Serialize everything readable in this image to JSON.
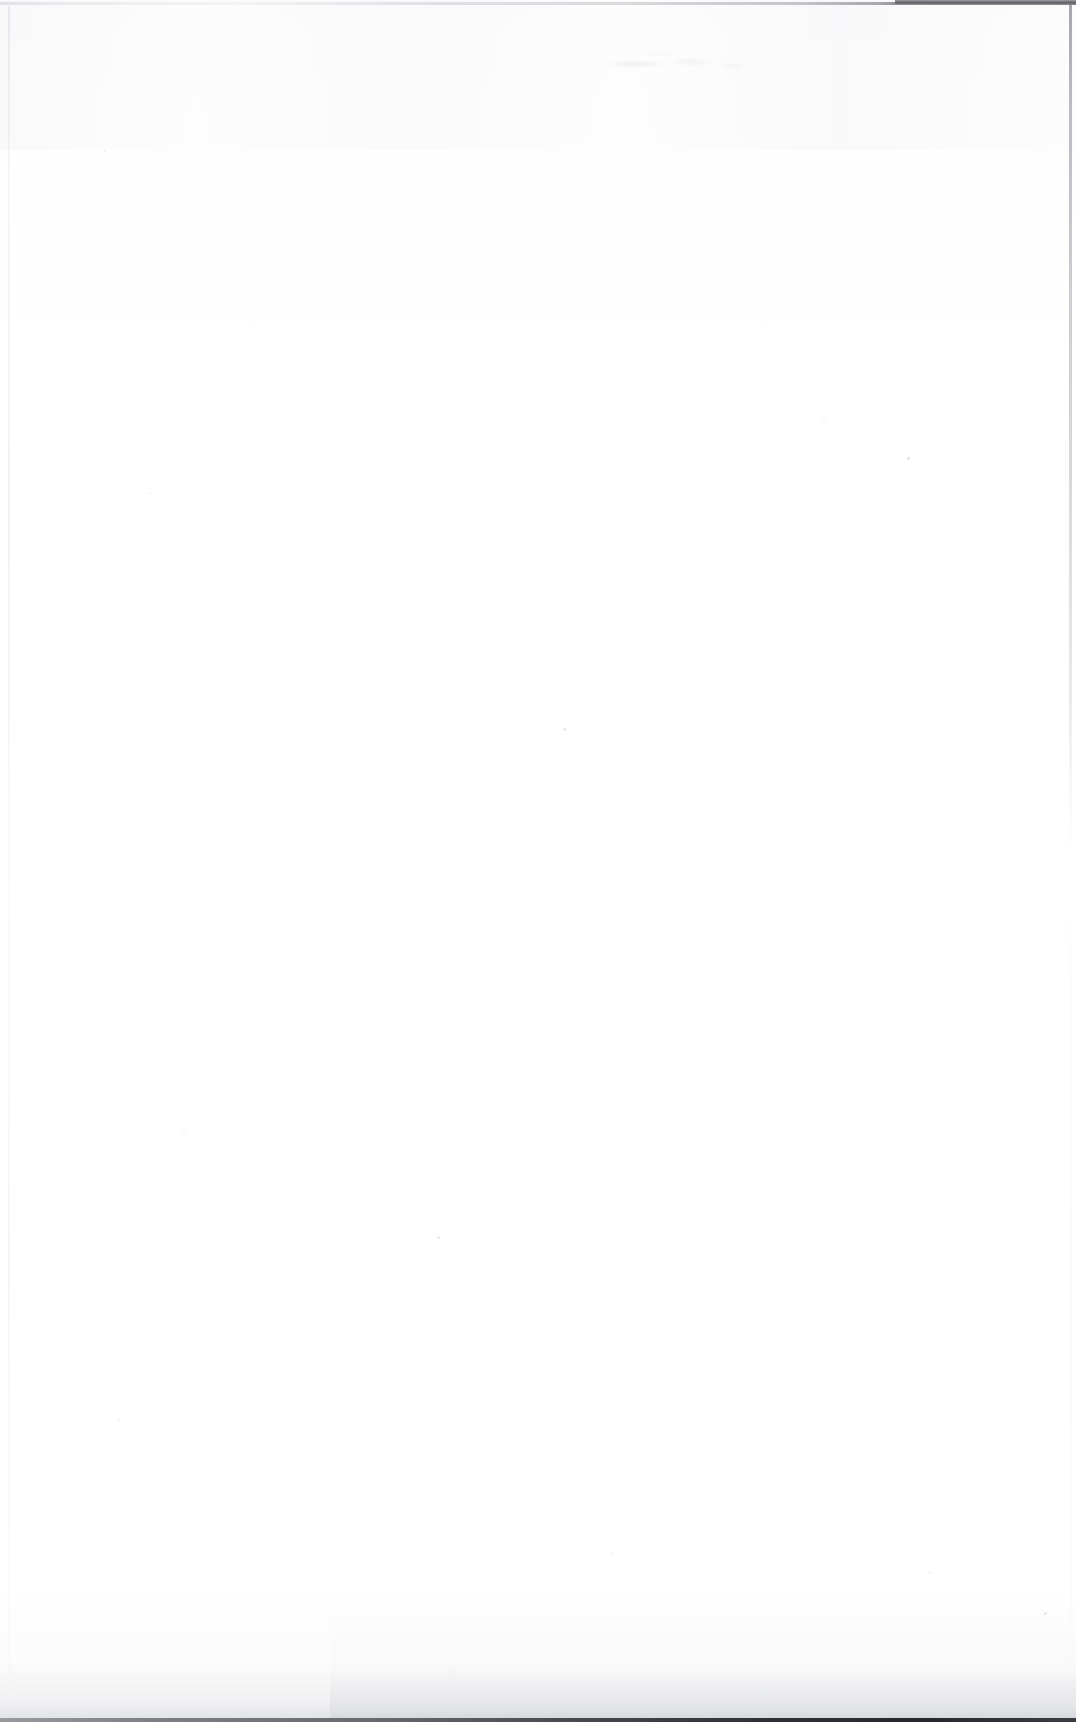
{
  "document": {
    "kind": "scanned-page",
    "page_state": "blank",
    "visible_text": "",
    "body_text_lines": [],
    "headings": [],
    "page_number_label": "",
    "header_text": "",
    "footer_text": "",
    "notes": ""
  },
  "canvas": {
    "width_px": 1076,
    "height_px": 1722,
    "paper_color": "#ffffff",
    "background_color": "#ffffff"
  },
  "scan_artifacts": {
    "description": "Blank scanned sheet; only page-boundary rules, a soft shadow gradient and dust specks are rendered.",
    "edges": [
      {
        "name": "top-edge-rule",
        "orientation": "horizontal",
        "x_px": 0,
        "y_px": 2,
        "length_px": 1076,
        "thickness_px": 3,
        "color_light": "#cdcfd3",
        "color_dark": "#686a70",
        "note": "faint at left, darkening toward the right"
      },
      {
        "name": "top-edge-dark-segment",
        "orientation": "horizontal",
        "x_px": 895,
        "y_px": 0,
        "length_px": 181,
        "thickness_px": 5,
        "color_dark": "#606268",
        "note": "distinctly dark band at the top-right corner"
      },
      {
        "name": "bottom-edge-rule",
        "orientation": "horizontal",
        "x_px": 0,
        "y_px": 1718,
        "length_px": 1076,
        "thickness_px": 4,
        "color_light": "#808288",
        "color_dark": "#26282e",
        "note": "spans full width, heaviest toward the right"
      },
      {
        "name": "left-edge-rule",
        "orientation": "vertical",
        "x_px": 8,
        "y_px": 6,
        "length_px": 1700,
        "thickness_px": 2,
        "color_light": "#f4f5f7",
        "color_dark": "#e0e1e5",
        "note": "extremely faint vertical hairline"
      },
      {
        "name": "right-edge-rule",
        "orientation": "vertical",
        "x_px": 1069,
        "y_px": 4,
        "length_px": 850,
        "thickness_px": 3,
        "color_light": "#e4e5e9",
        "color_dark": "#96989e",
        "note": "visible grey line that fades out near mid-page"
      }
    ],
    "shadow": {
      "name": "bottom-shadow-smudge",
      "y_px": 1590,
      "height_px": 130,
      "color": "#e0e1e4",
      "note": "soft grey gradient rising from the bottom rule"
    },
    "ghost_showthrough": {
      "name": "top-centre-ghost",
      "x_px": 600,
      "y_px": 48,
      "width_px": 160,
      "height_px": 26,
      "color": "#e4e5e9",
      "legible": false,
      "note": "extremely faint reverse-side show-through; no readable characters"
    },
    "specks": [
      {
        "x_px": 563,
        "y_px": 728,
        "size_px": 3,
        "color": "#e8e9ec"
      },
      {
        "x_px": 907,
        "y_px": 457,
        "size_px": 3,
        "color": "#dedfe3"
      },
      {
        "x_px": 437,
        "y_px": 1236,
        "size_px": 3,
        "color": "#e9eaed"
      },
      {
        "x_px": 1044,
        "y_px": 1612,
        "size_px": 3,
        "color": "#e6e7ea"
      },
      {
        "x_px": 183,
        "y_px": 1133,
        "size_px": 2,
        "color": "#edeef1"
      },
      {
        "x_px": 118,
        "y_px": 1419,
        "size_px": 2,
        "color": "#eff0f2"
      },
      {
        "x_px": 448,
        "y_px": 1671,
        "size_px": 2,
        "color": "#ebecef"
      },
      {
        "x_px": 823,
        "y_px": 417,
        "size_px": 2,
        "color": "#edeef1"
      },
      {
        "x_px": 104,
        "y_px": 150,
        "size_px": 2,
        "color": "#eceded"
      },
      {
        "x_px": 149,
        "y_px": 492,
        "size_px": 2,
        "color": "#f0f1f3"
      },
      {
        "x_px": 611,
        "y_px": 1553,
        "size_px": 2,
        "color": "#eeeff1"
      },
      {
        "x_px": 929,
        "y_px": 1572,
        "size_px": 2,
        "color": "#eceded"
      }
    ]
  }
}
